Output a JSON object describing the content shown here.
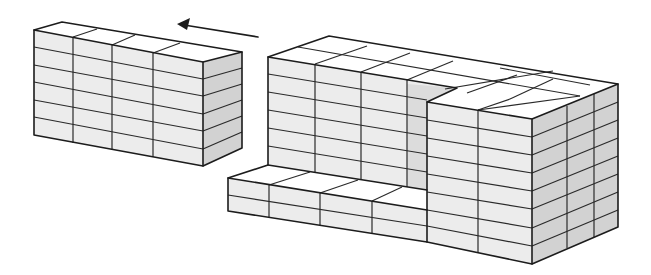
{
  "diagram": {
    "type": "isometric brick stacks",
    "colors": {
      "line": "#1c1c1c",
      "top_face": "#ffffff",
      "front_face": "#ececec",
      "side_face": "#d2d2d2"
    },
    "left_stack": {
      "columns": 4,
      "rows": 6,
      "depth_units": 1
    },
    "right_assembly": {
      "tall_back_section": {
        "columns": 3,
        "rows": 6
      },
      "front_right_section": {
        "columns": 2,
        "rows": 7,
        "depth_units": 2
      },
      "low_slab": {
        "columns": 4,
        "rows": 2
      }
    },
    "arrow": {
      "direction": "left",
      "meaning": "movement of left stack"
    }
  }
}
